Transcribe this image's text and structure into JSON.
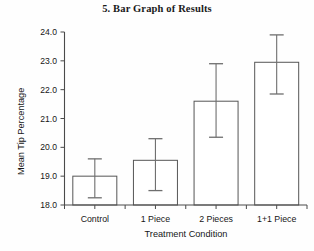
{
  "chart_data": {
    "type": "bar",
    "title": "5. Bar Graph of Results",
    "xlabel": "Treatment Condition",
    "ylabel": "Mean Tip Percentage",
    "categories": [
      "Control",
      "1 Piece",
      "2 Pieces",
      "1+1 Piece"
    ],
    "values": [
      19.0,
      19.55,
      21.6,
      22.95
    ],
    "error_upper": [
      19.6,
      20.3,
      22.9,
      23.9
    ],
    "error_lower": [
      18.25,
      18.5,
      20.35,
      21.85
    ],
    "ylim": [
      18.0,
      24.0
    ],
    "yticks": [
      "18.0",
      "19.0",
      "20.0",
      "21.0",
      "22.0",
      "23.0",
      "24.0"
    ],
    "ytick_values": [
      18.0,
      19.0,
      20.0,
      21.0,
      22.0,
      23.0,
      24.0
    ],
    "grid": false,
    "legend": "none",
    "bar_fill_color": "#ffffff",
    "bar_edge_color": "#565656",
    "error_bar_color": "#6e6e6e",
    "axis_color": "#4a4a4a"
  }
}
